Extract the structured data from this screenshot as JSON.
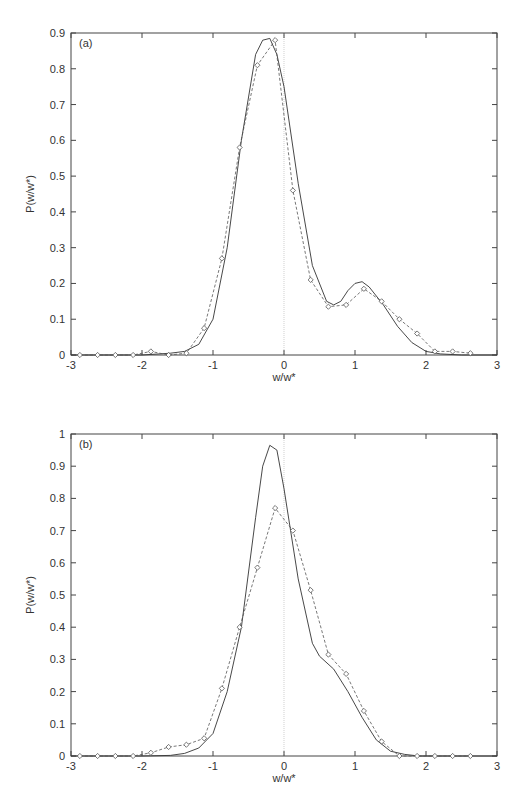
{
  "chart_data": [
    {
      "type": "line",
      "panel_label": "(a)",
      "xlabel": "w/w*",
      "ylabel": "P(w/w*)",
      "xlim": [
        -3,
        3
      ],
      "ylim": [
        0,
        0.9
      ],
      "xticks": [
        "-3",
        "-2",
        "-1",
        "0",
        "1",
        "2",
        "3"
      ],
      "yticks": [
        "0",
        "0.1",
        "0.2",
        "0.3",
        "0.4",
        "0.5",
        "0.6",
        "0.7",
        "0.8",
        "0.9"
      ],
      "grid": false,
      "vertical_reference_line_x": 0,
      "series": [
        {
          "name": "solid",
          "style": "solid line",
          "x": [
            -3.0,
            -2.0,
            -1.6,
            -1.4,
            -1.2,
            -1.0,
            -0.8,
            -0.6,
            -0.4,
            -0.3,
            -0.2,
            -0.1,
            0.0,
            0.2,
            0.4,
            0.6,
            0.7,
            0.8,
            0.9,
            1.0,
            1.1,
            1.2,
            1.4,
            1.6,
            1.8,
            2.0,
            2.2,
            2.5,
            3.0
          ],
          "y": [
            0.0,
            0.0,
            0.005,
            0.01,
            0.03,
            0.1,
            0.3,
            0.6,
            0.84,
            0.88,
            0.885,
            0.84,
            0.75,
            0.48,
            0.25,
            0.15,
            0.14,
            0.15,
            0.18,
            0.2,
            0.205,
            0.19,
            0.14,
            0.08,
            0.035,
            0.01,
            0.003,
            0.0,
            0.0
          ]
        },
        {
          "name": "dashed with diamonds",
          "style": "dashed line, diamond markers",
          "x": [
            -2.875,
            -2.625,
            -2.375,
            -2.125,
            -1.875,
            -1.625,
            -1.375,
            -1.125,
            -0.875,
            -0.625,
            -0.375,
            -0.125,
            0.125,
            0.375,
            0.625,
            0.875,
            1.125,
            1.375,
            1.625,
            1.875,
            2.125,
            2.375,
            2.625
          ],
          "y": [
            0.0,
            0.0,
            0.0,
            0.0,
            0.01,
            0.0,
            0.005,
            0.075,
            0.27,
            0.58,
            0.81,
            0.88,
            0.46,
            0.21,
            0.135,
            0.14,
            0.185,
            0.15,
            0.1,
            0.06,
            0.01,
            0.01,
            0.005
          ]
        }
      ]
    },
    {
      "type": "line",
      "panel_label": "(b)",
      "xlabel": "w/w*",
      "ylabel": "P(w/w*)",
      "xlim": [
        -3,
        3
      ],
      "ylim": [
        0,
        1
      ],
      "xticks": [
        "-3",
        "-2",
        "-1",
        "0",
        "1",
        "2",
        "3"
      ],
      "yticks": [
        "0",
        "0.1",
        "0.2",
        "0.3",
        "0.4",
        "0.5",
        "0.6",
        "0.7",
        "0.8",
        "0.9",
        "1"
      ],
      "grid": false,
      "vertical_reference_line_x": 0,
      "series": [
        {
          "name": "solid",
          "style": "solid line",
          "x": [
            -3.0,
            -2.0,
            -1.6,
            -1.4,
            -1.2,
            -1.0,
            -0.8,
            -0.6,
            -0.4,
            -0.3,
            -0.2,
            -0.1,
            0.0,
            0.2,
            0.4,
            0.5,
            0.7,
            0.9,
            1.1,
            1.3,
            1.5,
            1.7,
            1.9,
            2.2,
            3.0
          ],
          "y": [
            0.0,
            0.0,
            0.002,
            0.008,
            0.025,
            0.07,
            0.2,
            0.4,
            0.74,
            0.9,
            0.965,
            0.95,
            0.83,
            0.55,
            0.35,
            0.31,
            0.27,
            0.2,
            0.12,
            0.05,
            0.015,
            0.005,
            0.0,
            0.0,
            0.0
          ]
        },
        {
          "name": "dashed with diamonds",
          "style": "dashed line, diamond markers",
          "x": [
            -2.875,
            -2.625,
            -2.375,
            -2.125,
            -1.875,
            -1.625,
            -1.375,
            -1.125,
            -0.875,
            -0.625,
            -0.375,
            -0.125,
            0.125,
            0.375,
            0.625,
            0.875,
            1.125,
            1.375,
            1.625,
            1.875,
            2.125,
            2.375,
            2.625
          ],
          "y": [
            0.0,
            0.0,
            0.0,
            0.0,
            0.01,
            0.028,
            0.035,
            0.055,
            0.21,
            0.4,
            0.585,
            0.77,
            0.7,
            0.515,
            0.315,
            0.255,
            0.14,
            0.045,
            0.0,
            0.0,
            0.0,
            0.0,
            0.0
          ]
        }
      ]
    }
  ]
}
